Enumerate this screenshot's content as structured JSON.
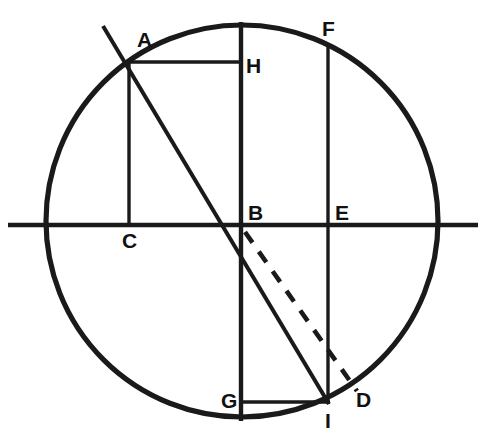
{
  "figure": {
    "type": "geometric-diagram",
    "canvas": {
      "width": 482,
      "height": 447
    },
    "background_color": "#ffffff",
    "stroke_color": "#1a1a1a"
  },
  "circle": {
    "center_x": 242,
    "center_y": 221,
    "radius": 196
  },
  "points": [
    {
      "id": "A",
      "label": "A",
      "x": 128,
      "y": 62,
      "label_x": 137,
      "label_y": 47
    },
    {
      "id": "B",
      "label": "B",
      "x": 241,
      "y": 224,
      "label_x": 248,
      "label_y": 220
    },
    {
      "id": "C",
      "label": "C",
      "x": 129,
      "y": 225,
      "label_x": 122,
      "label_y": 248
    },
    {
      "id": "D",
      "label": "D",
      "x": 352,
      "y": 385,
      "label_x": 356,
      "label_y": 407
    },
    {
      "id": "E",
      "label": "E",
      "x": 328,
      "y": 224,
      "label_x": 335,
      "label_y": 220
    },
    {
      "id": "F",
      "label": "F",
      "x": 328,
      "y": 46,
      "label_x": 322,
      "label_y": 36
    },
    {
      "id": "G",
      "label": "G",
      "x": 241,
      "y": 402,
      "label_x": 221,
      "label_y": 408
    },
    {
      "id": "H",
      "label": "H",
      "x": 241,
      "y": 62,
      "label_x": 246,
      "label_y": 73
    },
    {
      "id": "I",
      "label": "I",
      "x": 328,
      "y": 402,
      "label_x": 325,
      "label_y": 428
    }
  ],
  "segments": [
    {
      "name": "horizontal-axis",
      "x1": 8,
      "y1": 225,
      "x2": 478,
      "y2": 225,
      "style": "axis"
    },
    {
      "name": "vertical-diameter",
      "x1": 241,
      "y1": 22,
      "x2": 241,
      "y2": 421,
      "style": "axis"
    },
    {
      "name": "segment-A-C",
      "x1": 129,
      "y1": 62,
      "x2": 129,
      "y2": 226,
      "style": "thin"
    },
    {
      "name": "segment-A-H",
      "x1": 128,
      "y1": 62,
      "x2": 243,
      "y2": 62,
      "style": "thin"
    },
    {
      "name": "segment-F-E-I",
      "x1": 328,
      "y1": 46,
      "x2": 328,
      "y2": 404,
      "style": "thin"
    },
    {
      "name": "segment-G-I",
      "x1": 239,
      "y1": 402,
      "x2": 330,
      "y2": 402,
      "style": "thin"
    },
    {
      "name": "chord-A-I-extended",
      "x1": 103,
      "y1": 26,
      "x2": 329,
      "y2": 404,
      "style": "chord"
    }
  ],
  "dashed_segments": [
    {
      "name": "dashed-B-D",
      "x1": 245,
      "y1": 232,
      "x2": 357,
      "y2": 391
    }
  ]
}
